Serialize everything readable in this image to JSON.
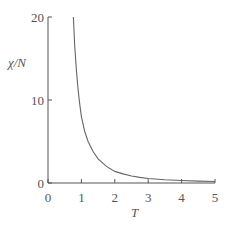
{
  "chart_data": {
    "type": "line",
    "title": "",
    "xlabel": "T",
    "ylabel": "χ/N",
    "xlim": [
      0,
      5
    ],
    "ylim": [
      0,
      20
    ],
    "xticks": [
      0,
      1,
      2,
      3,
      4,
      5
    ],
    "xtick_labels": [
      "0",
      "1",
      "2",
      "3",
      "4",
      "5"
    ],
    "yticks": [
      0,
      10,
      20
    ],
    "ytick_labels": [
      "0",
      "10",
      "20"
    ],
    "grid": false,
    "legend": null,
    "series": [
      {
        "name": "χ/N vs T",
        "x": [
          0.76,
          0.8,
          0.85,
          0.9,
          0.95,
          1.0,
          1.1,
          1.2,
          1.35,
          1.5,
          1.75,
          2.0,
          2.25,
          2.5,
          2.75,
          3.0,
          3.5,
          4.0,
          4.5,
          5.0
        ],
        "y": [
          20,
          16.5,
          13.6,
          11.3,
          9.5,
          8.0,
          6.2,
          5.0,
          3.8,
          2.9,
          2.0,
          1.4,
          1.1,
          0.85,
          0.68,
          0.55,
          0.4,
          0.3,
          0.23,
          0.18
        ]
      }
    ]
  },
  "style": {
    "ink_color": "#555555",
    "curve_color": "#666666",
    "background": "#ffffff"
  }
}
